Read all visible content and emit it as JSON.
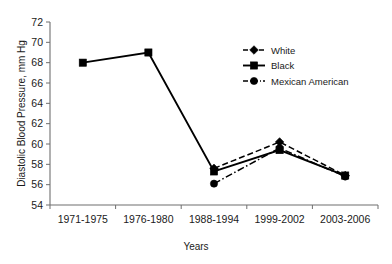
{
  "chart_data": {
    "type": "line",
    "title": "",
    "xlabel": "Years",
    "ylabel": "Diastolic Blood Pressure, mm Hg",
    "categories": [
      "1971-1975",
      "1976-1980",
      "1988-1994",
      "1999-2002",
      "2003-2006"
    ],
    "ylim": [
      54,
      72
    ],
    "yticks": [
      54,
      56,
      58,
      60,
      62,
      64,
      66,
      68,
      70,
      72
    ],
    "grid": false,
    "legend_position": "upper-right",
    "series": [
      {
        "name": "White",
        "marker": "diamond",
        "line_style": "dashed",
        "color": "#000000",
        "values": [
          null,
          null,
          57.6,
          60.2,
          56.9
        ]
      },
      {
        "name": "Black",
        "marker": "square",
        "line_style": "solid",
        "color": "#000000",
        "values": [
          68.0,
          69.0,
          57.3,
          59.4,
          56.9
        ]
      },
      {
        "name": "Mexican American",
        "marker": "circle",
        "line_style": "dash-dot",
        "color": "#000000",
        "values": [
          null,
          null,
          56.1,
          59.6,
          56.8
        ]
      }
    ]
  },
  "axis": {
    "y_title": "Diastolic Blood Pressure, mm Hg",
    "x_title": "Years",
    "y_tick_labels": [
      "72",
      "70",
      "68",
      "66",
      "64",
      "62",
      "60",
      "58",
      "56",
      "54"
    ],
    "x_tick_labels": [
      "1971-1975",
      "1976-1980",
      "1988-1994",
      "1999-2002",
      "2003-2006"
    ]
  },
  "legend": {
    "items": [
      {
        "label": "White"
      },
      {
        "label": "Black"
      },
      {
        "label": "Mexican American"
      }
    ]
  }
}
